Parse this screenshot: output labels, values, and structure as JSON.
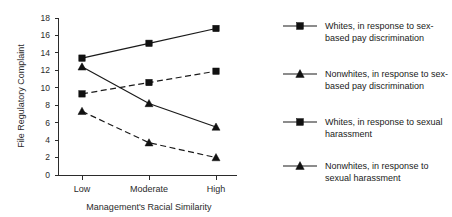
{
  "chart_data": {
    "type": "line",
    "title": "",
    "xlabel": "Management's Racial Similarity",
    "ylabel": "File Regulatory Complaint",
    "categories": [
      "Low",
      "Moderate",
      "High"
    ],
    "ylim": [
      0,
      18
    ],
    "yticks": [
      0,
      2,
      4,
      6,
      8,
      10,
      12,
      14,
      16,
      18
    ],
    "ytick_labels": [
      "0",
      "2",
      "4",
      "6",
      "8",
      "10",
      "12",
      "14",
      "16",
      "18"
    ],
    "grid": false,
    "legend_position": "right",
    "series": [
      {
        "name": "Whites, in response to sex-based pay discrimination",
        "values": [
          13.4,
          15.1,
          16.8
        ],
        "linestyle": "solid",
        "marker": "square",
        "color": "#111111"
      },
      {
        "name": "Nonwhites, in response to sex-based pay discrimination",
        "values": [
          9.3,
          10.6,
          11.9
        ],
        "linestyle": "dashed",
        "marker": "square",
        "color": "#111111"
      },
      {
        "name": "Whites, in response to sexual harassment",
        "values": [
          12.4,
          8.2,
          5.5
        ],
        "linestyle": "solid",
        "marker": "triangle",
        "color": "#111111"
      },
      {
        "name": "Nonwhites, in response to sexual harassment",
        "values": [
          7.3,
          3.7,
          2.0
        ],
        "linestyle": "dashed",
        "marker": "triangle",
        "color": "#111111"
      }
    ]
  },
  "axes": {
    "y_title": "File Regulatory Complaint",
    "x_title": "Management's Racial Similarity",
    "ytick_0": "0",
    "ytick_2": "2",
    "ytick_4": "4",
    "ytick_6": "6",
    "ytick_8": "8",
    "ytick_10": "10",
    "ytick_12": "12",
    "ytick_14": "14",
    "ytick_16": "16",
    "ytick_18": "18",
    "xtick_low": "Low",
    "xtick_moderate": "Moderate",
    "xtick_high": "High"
  },
  "legend": {
    "items": [
      {
        "line1": "Whites, in response to sex-",
        "line2": "based pay discrimination",
        "marker": "square",
        "linestyle": "solid"
      },
      {
        "line1": "Nonwhites, in response to sex-",
        "line2": "based pay discrimination",
        "marker": "triangle",
        "linestyle": "solid"
      },
      {
        "line1": "Whites, in response to sexual",
        "line2": "harassment",
        "marker": "square",
        "linestyle": "solid"
      },
      {
        "line1": "Nonwhites, in response to",
        "line2": "sexual harassment",
        "marker": "triangle",
        "linestyle": "solid"
      }
    ]
  }
}
